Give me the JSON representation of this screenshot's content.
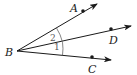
{
  "diagram": {
    "type": "geometry-angles",
    "vertex": {
      "label": "B",
      "x": 17,
      "y": 51,
      "label_x": 5,
      "label_y": 56
    },
    "rays": [
      {
        "name": "BA",
        "point_label": "A",
        "point": {
          "x": 83,
          "y": 11
        },
        "tip": {
          "x": 97,
          "y": 4
        },
        "label_x": 70,
        "label_y": 12
      },
      {
        "name": "BD",
        "point_label": "D",
        "point": {
          "x": 111,
          "y": 29
        },
        "tip": {
          "x": 131,
          "y": 26
        },
        "label_x": 109,
        "label_y": 44
      },
      {
        "name": "BC",
        "point_label": "C",
        "point": {
          "x": 92,
          "y": 57
        },
        "tip": {
          "x": 111,
          "y": 60
        },
        "label_x": 88,
        "label_y": 73
      }
    ],
    "angles": [
      {
        "label": "2",
        "between": "BA-BD",
        "label_x": 50,
        "label_y": 41
      },
      {
        "label": "1",
        "between": "BD-BC",
        "label_x": 54,
        "label_y": 50
      }
    ],
    "colors": {
      "line": "#1a1a1a",
      "arc": "#666666"
    }
  }
}
